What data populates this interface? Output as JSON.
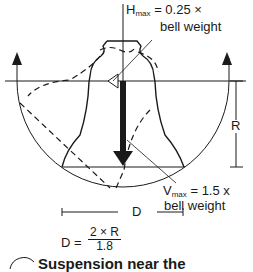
{
  "diagram": {
    "h_max": {
      "symbol": "H",
      "subscript": "max",
      "expr": "= 0.25 ×",
      "line2": "bell weight"
    },
    "v_max": {
      "symbol": "V",
      "subscript": "max",
      "expr": "= 1.5 x",
      "line2": "bell weight"
    },
    "r_label": "R",
    "d_label": "D",
    "formula": {
      "lhs": "D =",
      "numerator": "2 × R",
      "denominator": "1.8"
    },
    "caption": "Suspension near the"
  },
  "colors": {
    "ink": "#1a1a1a",
    "background": "#ffffff"
  }
}
